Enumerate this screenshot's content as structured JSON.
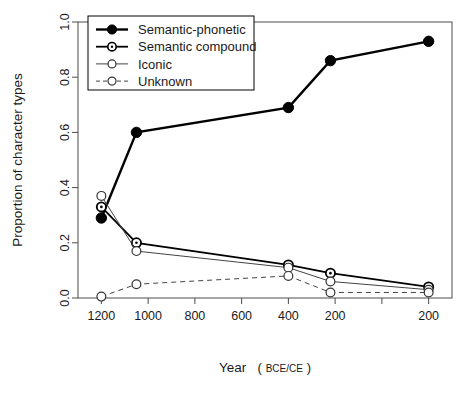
{
  "chart_data": {
    "type": "line",
    "title": "",
    "xlabel": "Year (BCE/CE)",
    "xlabel_main": "Year",
    "xlabel_unit_open": "(",
    "xlabel_unit": "BCE/CE",
    "xlabel_unit_close": ")",
    "ylabel": "Proportion of character types",
    "x": [
      1200,
      1050,
      400,
      220,
      200
    ],
    "x_plot": [
      1200,
      1050,
      400,
      220,
      -200
    ],
    "xlim": [
      1300,
      -300
    ],
    "ylim": [
      0.0,
      1.0
    ],
    "grid": false,
    "legend_position": "top-left",
    "xticks": [
      1200,
      1000,
      800,
      600,
      400,
      200,
      0,
      -200
    ],
    "xticklabels": [
      "1200",
      "1000",
      "800",
      "600",
      "400",
      "200",
      "",
      "200"
    ],
    "yticks": [
      0.0,
      0.2,
      0.4,
      0.6,
      0.8,
      1.0
    ],
    "yticklabels": [
      "0.0",
      "0.2",
      "0.4",
      "0.6",
      "0.8",
      "1.0"
    ],
    "series": [
      {
        "name": "Semantic-phonetic",
        "marker": "filled-circle",
        "linestyle": "solid",
        "linewidth": 2.4,
        "color": "#000000",
        "values": [
          0.29,
          0.6,
          0.69,
          0.86,
          0.93
        ]
      },
      {
        "name": "Semantic compound",
        "marker": "dotted-circle",
        "linestyle": "solid",
        "linewidth": 1.8,
        "color": "#000000",
        "values": [
          0.33,
          0.2,
          0.12,
          0.09,
          0.04
        ]
      },
      {
        "name": "Iconic",
        "marker": "open-circle",
        "linestyle": "solid",
        "linewidth": 1.0,
        "color": "#444444",
        "values": [
          0.37,
          0.17,
          0.11,
          0.06,
          0.03
        ]
      },
      {
        "name": "Unknown",
        "marker": "open-circle",
        "linestyle": "dashed",
        "linewidth": 1.0,
        "color": "#444444",
        "values": [
          0.005,
          0.05,
          0.08,
          0.02,
          0.02
        ]
      }
    ]
  },
  "legend": {
    "entries": [
      {
        "label": "Semantic-phonetic"
      },
      {
        "label": "Semantic compound"
      },
      {
        "label": "Iconic"
      },
      {
        "label": "Unknown"
      }
    ]
  }
}
